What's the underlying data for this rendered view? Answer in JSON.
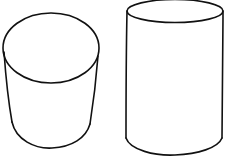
{
  "diagram": {
    "stroke_color": "#111111",
    "background": "#ffffff",
    "shapes": [
      {
        "name": "tapered-cylinder",
        "type": "cylinder",
        "position": "left"
      },
      {
        "name": "tall-cylinder",
        "type": "cylinder",
        "position": "right"
      }
    ]
  }
}
